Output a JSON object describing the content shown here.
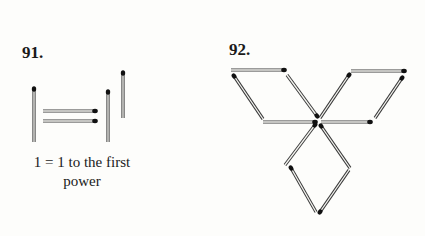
{
  "puzzles": [
    {
      "number": "91.",
      "caption_line1": "1 = 1 to the first",
      "caption_line2": "power",
      "matches": [
        {
          "x1": 34,
          "y1": 89,
          "x2": 34,
          "y2": 142
        },
        {
          "x1": 95,
          "y1": 111,
          "x2": 43,
          "y2": 111
        },
        {
          "x1": 95,
          "y1": 121,
          "x2": 43,
          "y2": 121
        },
        {
          "x1": 108,
          "y1": 92,
          "x2": 108,
          "y2": 142
        },
        {
          "x1": 123,
          "y1": 73,
          "x2": 123,
          "y2": 118
        }
      ]
    },
    {
      "number": "92.",
      "matches": [
        {
          "x1": 284,
          "y1": 70,
          "x2": 231,
          "y2": 70
        },
        {
          "x1": 234,
          "y1": 76,
          "x2": 263,
          "y2": 119
        },
        {
          "x1": 317,
          "y1": 116,
          "x2": 287,
          "y2": 75
        },
        {
          "x1": 315,
          "y1": 122,
          "x2": 263,
          "y2": 122
        },
        {
          "x1": 404,
          "y1": 71,
          "x2": 351,
          "y2": 71
        },
        {
          "x1": 349,
          "y1": 75,
          "x2": 320,
          "y2": 118
        },
        {
          "x1": 402,
          "y1": 78,
          "x2": 375,
          "y2": 118
        },
        {
          "x1": 370,
          "y1": 122,
          "x2": 321,
          "y2": 122
        },
        {
          "x1": 315,
          "y1": 125,
          "x2": 285,
          "y2": 165
        },
        {
          "x1": 321,
          "y1": 126,
          "x2": 350,
          "y2": 168
        },
        {
          "x1": 291,
          "y1": 168,
          "x2": 316,
          "y2": 212
        },
        {
          "x1": 320,
          "y1": 212,
          "x2": 349,
          "y2": 170
        }
      ]
    }
  ],
  "colors": {
    "stick_outline": "#3a3a3a",
    "stick_fill": "#f4f4f0",
    "head": "#111111"
  }
}
